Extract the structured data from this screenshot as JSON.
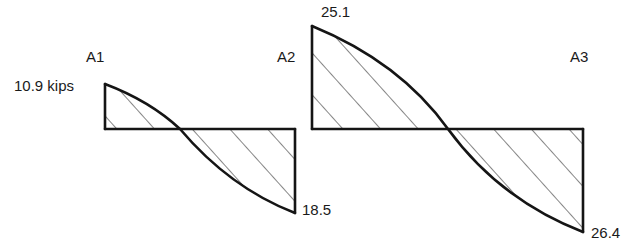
{
  "diagram": {
    "type": "shear-force-diagram",
    "supports": [
      {
        "label": "A1"
      },
      {
        "label": "A2"
      },
      {
        "label": "A3"
      }
    ],
    "spans": [
      {
        "from": "A1",
        "to": "A2",
        "start_value_label": "10.9 kips",
        "end_value_label": "18.5",
        "start_value": 10.9,
        "end_value": -18.5
      },
      {
        "from": "A2",
        "to": "A3",
        "start_value_label": "25.1",
        "end_value_label": "26.4",
        "start_value": 25.1,
        "end_value": -26.4
      }
    ],
    "unit": "kips",
    "colors": {
      "line": "#151515",
      "background": "#ffffff"
    }
  }
}
